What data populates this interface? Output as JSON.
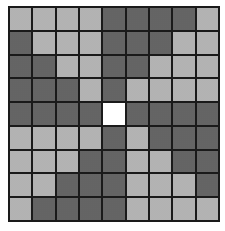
{
  "grid": {
    "rows": 9,
    "cols": 9,
    "legend": {
      "L": "light",
      "D": "dark",
      "W": "white"
    },
    "colors": {
      "light": "#c8c8c8",
      "dark": "#7a7a7a",
      "white": "#ffffff",
      "border": "#1a1a1a"
    },
    "cells": [
      [
        "L",
        "L",
        "L",
        "L",
        "D",
        "D",
        "D",
        "D",
        "L"
      ],
      [
        "D",
        "L",
        "L",
        "L",
        "D",
        "D",
        "D",
        "L",
        "L"
      ],
      [
        "D",
        "D",
        "L",
        "L",
        "D",
        "D",
        "L",
        "L",
        "L"
      ],
      [
        "D",
        "D",
        "D",
        "L",
        "D",
        "L",
        "L",
        "L",
        "L"
      ],
      [
        "D",
        "D",
        "D",
        "D",
        "W",
        "D",
        "D",
        "D",
        "D"
      ],
      [
        "L",
        "L",
        "L",
        "L",
        "D",
        "L",
        "D",
        "D",
        "D"
      ],
      [
        "L",
        "L",
        "L",
        "D",
        "D",
        "L",
        "L",
        "D",
        "D"
      ],
      [
        "L",
        "L",
        "D",
        "D",
        "D",
        "L",
        "L",
        "L",
        "D"
      ],
      [
        "L",
        "D",
        "D",
        "D",
        "D",
        "L",
        "L",
        "L",
        "L"
      ]
    ]
  }
}
